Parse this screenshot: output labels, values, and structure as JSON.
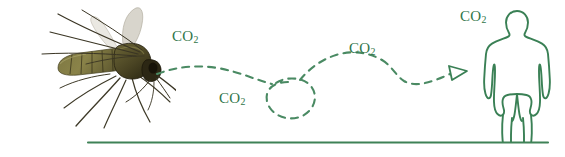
{
  "canvas": {
    "width": 565,
    "height": 157,
    "background_color": "#ffffff"
  },
  "colors": {
    "accent_green": "#3a8055",
    "path_green": "#4a8a63",
    "ground_green": "#3f8257",
    "text_green": "#2f7549",
    "mosquito_body": "#6e6a3a",
    "mosquito_dark": "#2e2a18",
    "mosquito_wing": "#d8d5cc",
    "mosquito_leg": "#4a4535"
  },
  "diagram": {
    "mosquito": {
      "name": "mosquito",
      "alt": "Photograph of a mosquito in flight facing right"
    },
    "human": {
      "name": "human-silhouette",
      "alt": "Outline silhouette of a standing person"
    },
    "flight_path": {
      "name": "mosquito-flight-path",
      "style": "dashed",
      "direction": "left-to-right toward human",
      "has_loop": true,
      "arrowhead": "open-triangle"
    },
    "ground": {
      "name": "ground-line",
      "x_start": 88,
      "x_end": 548,
      "y": 142
    },
    "co2_labels": [
      {
        "text": "CO",
        "sub": "2",
        "x": 172,
        "y": 28
      },
      {
        "text": "CO",
        "sub": "2",
        "x": 219,
        "y": 90
      },
      {
        "text": "CO",
        "sub": "2",
        "x": 349,
        "y": 40
      },
      {
        "text": "CO",
        "sub": "2",
        "x": 460,
        "y": 8
      }
    ]
  }
}
